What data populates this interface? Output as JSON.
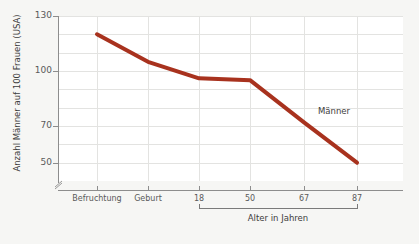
{
  "chart_data": {
    "type": "line",
    "title": "",
    "xlabel": "Alter in Jahren",
    "ylabel": "Anzahl Männer auf 100 Frauen (USA)",
    "categories": [
      "Befruchtung",
      "Geburt",
      "18",
      "50",
      "67",
      "87"
    ],
    "series": [
      {
        "name": "Männer",
        "color": "#a8321e",
        "values": [
          120,
          105,
          96,
          95,
          72,
          50
        ]
      }
    ],
    "ylim": [
      40,
      130
    ],
    "y_ticks_major": [
      130,
      100,
      70,
      50
    ],
    "y_ticks_minor": [
      120,
      110,
      90,
      80,
      60
    ],
    "y_axis_break": true,
    "grid": true,
    "legend": "none",
    "annotations": [
      {
        "text": "Männer",
        "x_category": "67",
        "y_value": 78
      }
    ],
    "x_bracket": {
      "from": "18",
      "to": "87",
      "label": "Alter in Jahren"
    }
  },
  "axes": {
    "y_title": "Anzahl Männer auf 100 Frauen (USA)",
    "y_labels": [
      "130",
      "100",
      "70",
      "50"
    ],
    "x_labels": [
      "Befruchtung",
      "Geburt",
      "18",
      "50",
      "67",
      "87"
    ],
    "x_bracket_label": "Alter in Jahren"
  },
  "annotation": {
    "series_label": "Männer"
  },
  "colors": {
    "line": "#a8321e",
    "page_bg": "#f6f6f4",
    "plot_bg": "#ffffff",
    "grid": "#e3e3e1",
    "axis": "#8d8d8d",
    "text": "#5a5a5a"
  }
}
